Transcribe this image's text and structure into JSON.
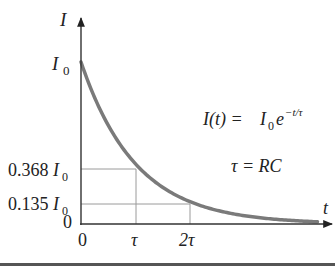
{
  "chart_data": {
    "type": "line",
    "title": "",
    "xlabel": "t",
    "ylabel": "I",
    "function": "I(t) = I0 e^(-t/tau)",
    "x_ticks": [
      "0",
      "τ",
      "2τ"
    ],
    "y_ticks": [
      "0",
      "0.135I0",
      "0.368I0",
      "I0"
    ],
    "series": [
      {
        "name": "I(t)",
        "x_in_tau": [
          0,
          0.5,
          1,
          1.5,
          2,
          2.5,
          3,
          3.5,
          4.3
        ],
        "values_fraction_of_I0": [
          1.0,
          0.607,
          0.368,
          0.223,
          0.135,
          0.082,
          0.05,
          0.03,
          0.014
        ]
      }
    ],
    "reference_points": [
      {
        "x": "τ",
        "y": "0.368I0"
      },
      {
        "x": "2τ",
        "y": "0.135I0"
      }
    ],
    "annotations": [
      "I(t) = I0 e^(-t/τ)",
      "τ = RC"
    ],
    "grid": false,
    "colors": {
      "curve": "#7a7a7a",
      "axes": "#333333",
      "guides": "#9a9a9a"
    }
  },
  "labels": {
    "y_axis": "I",
    "x_axis": "t",
    "y_I0_main": "I",
    "y_I0_sub": "0",
    "y_0368_num": "0.368",
    "y_0368_main": "I",
    "y_0368_sub": "0",
    "y_0135_num": "0.135",
    "y_0135_main": "I",
    "y_0135_sub": "0",
    "y_zero": "0",
    "x_zero": "0",
    "x_tau": "τ",
    "x_2tau": "2τ",
    "eq1_lhs": "I(t) = ",
    "eq1_I": "I",
    "eq1_sub": "0",
    "eq1_e": "e",
    "eq1_exp": "−t/τ",
    "eq2": "τ = RC"
  }
}
